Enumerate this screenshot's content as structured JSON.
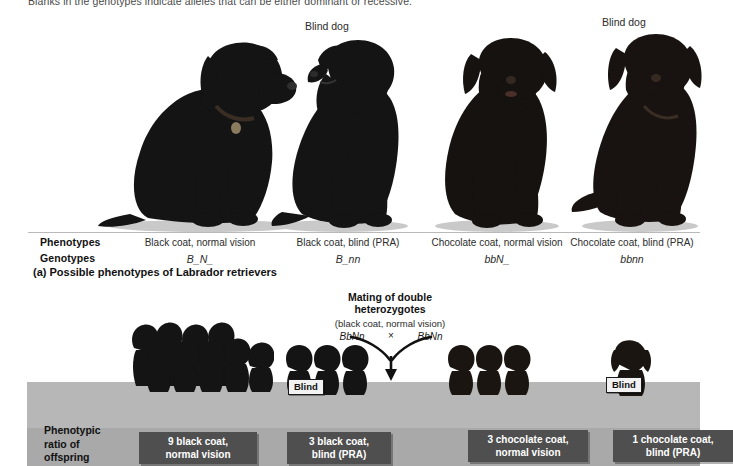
{
  "figure": {
    "intro_text": "Blanks in the genotypes indicate alleles that can be either dominant or recessive.",
    "caption_a": "(a) Possible phenotypes of Labrador retrievers"
  },
  "panel_a": {
    "row_labels": {
      "phenotypes": "Phenotypes",
      "genotypes": "Genotypes"
    },
    "blind_dog_labels": [
      "Blind dog",
      "Blind dog"
    ],
    "columns": [
      {
        "phenotype": "Black coat, normal vision",
        "genotype": "B_N_",
        "blind": false
      },
      {
        "phenotype": "Black coat, blind (PRA)",
        "genotype": "B_nn",
        "blind": true
      },
      {
        "phenotype": "Chocolate coat, normal vision",
        "genotype": "bbN_",
        "blind": false
      },
      {
        "phenotype": "Chocolate coat, blind (PRA)",
        "genotype": "bbnn",
        "blind": true
      }
    ]
  },
  "panel_b": {
    "mating_title": "Mating of double\nheterozygotes",
    "mating_title_line1": "Mating of double",
    "mating_title_line2": "heterozygotes",
    "parent_phenotype": "(black coat, normal vision)",
    "parent_genotype_left": "BbNn",
    "parent_genotype_right": "BbNn",
    "cross_symbol": "×",
    "ratio_label_lines": [
      "Phenotypic",
      "ratio of",
      "offspring"
    ],
    "blind_badges": [
      "Blind",
      "Blind"
    ],
    "offspring_groups": [
      {
        "count": 9,
        "line1": "9 black coat,",
        "line2": "normal vision",
        "coat": "black",
        "blind": false
      },
      {
        "count": 3,
        "line1": "3 black coat,",
        "line2": "blind (PRA)",
        "coat": "black",
        "blind": true
      },
      {
        "count": 3,
        "line1": "3 chocolate coat,",
        "line2": "normal vision",
        "coat": "chocolate",
        "blind": false
      },
      {
        "count": 1,
        "line1": "1 chocolate coat,",
        "line2": "blind (PRA)",
        "coat": "chocolate",
        "blind": true
      }
    ]
  },
  "colors": {
    "ratio_box_bg": "#4f4f4f",
    "ratio_box_text": "#ffffff",
    "floor_band": "#b7b7b7",
    "floor_band_lower": "#a9a9a9",
    "dog_black": "#1c1c1c",
    "dog_chocolate": "#2a2018"
  }
}
